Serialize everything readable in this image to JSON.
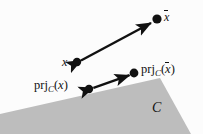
{
  "figure": {
    "name": "projection-onto-cone-diagram",
    "background_color": "#fcfcfc",
    "width": 203,
    "height": 134,
    "ink_color": "#111111",
    "cone_fill_color": "#bdbdbd"
  },
  "labels": {
    "x": "x",
    "x_bar_base": "x",
    "proj_x": {
      "head": "prj",
      "subscript": "C",
      "open": "(",
      "arg": "x",
      "close": ")"
    },
    "proj_x_bar": {
      "head": "prj",
      "subscript": "C",
      "open": "(",
      "arg": "x",
      "close": ")"
    },
    "set_C": "C"
  },
  "points": [
    {
      "name": "point-x",
      "label": "x",
      "cx": 77,
      "cy": 62,
      "r": 4.2
    },
    {
      "name": "point-x-bar",
      "label": "x̄",
      "cx": 157,
      "cy": 19,
      "r": 4.6
    },
    {
      "name": "point-proj-x",
      "label": "prj_C(x)",
      "cx": 89,
      "cy": 89,
      "r": 4.2
    },
    {
      "name": "point-proj-x-bar",
      "label": "prj_C(x̄)",
      "cx": 134,
      "cy": 73,
      "r": 4.4
    }
  ],
  "arrows": [
    {
      "name": "arrow-x-to-x-bar",
      "from": [
        80,
        60
      ],
      "to": [
        152,
        22
      ],
      "double_headed": true
    },
    {
      "name": "arrow-proj-x-to-proj-x-bar",
      "from": [
        93,
        88
      ],
      "to": [
        130,
        75
      ],
      "double_headed": true
    }
  ],
  "cone": {
    "name": "convex-cone-region",
    "apex": [
      160,
      78
    ],
    "vertices": "160,78 0,114 0,134 191,134"
  }
}
